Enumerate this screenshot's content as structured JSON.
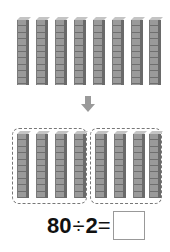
{
  "figure": {
    "top_rods": {
      "count": 8,
      "cubes_per_rod": 10
    },
    "arrow": {
      "direction": "down",
      "icon": "down-arrow-icon",
      "color": "#9a9a9a"
    },
    "groups": [
      {
        "label": "group-1",
        "rods": 4
      },
      {
        "label": "group-2",
        "rods": 4
      }
    ]
  },
  "equation": {
    "dividend": "80",
    "operator": "÷",
    "divisor": "2",
    "equals": "=",
    "answer": ""
  }
}
